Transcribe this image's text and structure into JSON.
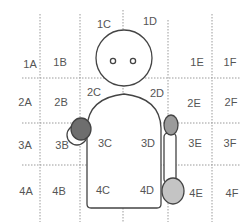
{
  "diagram": {
    "type": "body-zone-grid",
    "colors": {
      "grid": "#9a9a9a",
      "outline": "#444444",
      "label": "#555555",
      "dark_fill": "#6e6e6e",
      "mid_fill": "#9b9b9b",
      "light_fill": "#c4c4c4"
    },
    "cells": [
      {
        "id": "1A",
        "label": "1A",
        "x": 30,
        "y": 64
      },
      {
        "id": "1B",
        "label": "1B",
        "x": 60,
        "y": 62
      },
      {
        "id": "1C",
        "label": "1C",
        "x": 104,
        "y": 24
      },
      {
        "id": "1D",
        "label": "1D",
        "x": 150,
        "y": 21
      },
      {
        "id": "1E",
        "label": "1E",
        "x": 197,
        "y": 62
      },
      {
        "id": "1F",
        "label": "1F",
        "x": 230,
        "y": 62
      },
      {
        "id": "2A",
        "label": "2A",
        "x": 25,
        "y": 102
      },
      {
        "id": "2B",
        "label": "2B",
        "x": 61,
        "y": 102
      },
      {
        "id": "2C",
        "label": "2C",
        "x": 94,
        "y": 92
      },
      {
        "id": "2D",
        "label": "2D",
        "x": 157,
        "y": 93
      },
      {
        "id": "2E",
        "label": "2E",
        "x": 194,
        "y": 103
      },
      {
        "id": "2F",
        "label": "2F",
        "x": 231,
        "y": 102
      },
      {
        "id": "3A",
        "label": "3A",
        "x": 25,
        "y": 145
      },
      {
        "id": "3B",
        "label": "3B",
        "x": 62,
        "y": 145
      },
      {
        "id": "3C",
        "label": "3C",
        "x": 105,
        "y": 143
      },
      {
        "id": "3D",
        "label": "3D",
        "x": 148,
        "y": 143
      },
      {
        "id": "3E",
        "label": "3E",
        "x": 195,
        "y": 143
      },
      {
        "id": "3F",
        "label": "3F",
        "x": 230,
        "y": 143
      },
      {
        "id": "4A",
        "label": "4A",
        "x": 26,
        "y": 191
      },
      {
        "id": "4B",
        "label": "4B",
        "x": 59,
        "y": 191
      },
      {
        "id": "4C",
        "label": "4C",
        "x": 103,
        "y": 190
      },
      {
        "id": "4D",
        "label": "4D",
        "x": 147,
        "y": 190
      },
      {
        "id": "4E",
        "label": "4E",
        "x": 196,
        "y": 193
      },
      {
        "id": "4F",
        "label": "4F",
        "x": 232,
        "y": 193
      }
    ]
  }
}
